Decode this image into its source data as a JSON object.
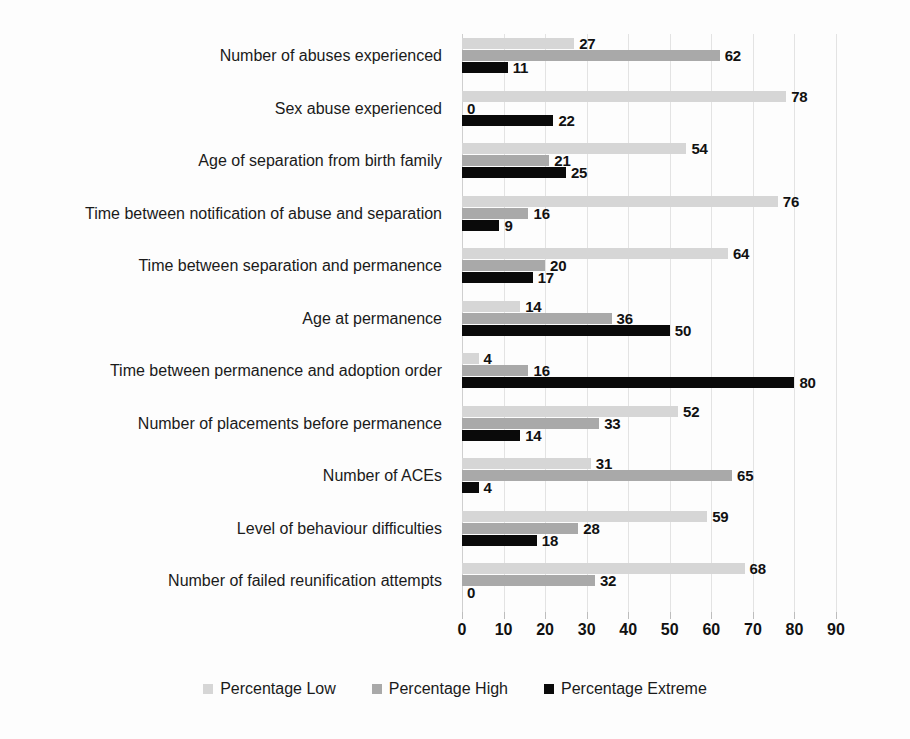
{
  "chart_data": {
    "type": "bar",
    "orientation": "horizontal",
    "title": "",
    "subtitle": "",
    "xlabel": "",
    "ylabel": "",
    "xlim": [
      0,
      90
    ],
    "xticks": [
      0,
      10,
      20,
      30,
      40,
      50,
      60,
      70,
      80,
      90
    ],
    "grid": true,
    "legend_position": "bottom",
    "categories": [
      "Number of abuses experienced",
      "Sex abuse experienced",
      "Age of separation from birth family",
      "Time between notification of abuse and separation",
      "Time between separation and permanence",
      "Age at permanence",
      "Time between permanence and adoption order",
      "Number of placements before permanence",
      "Number of ACEs",
      "Level of behaviour difficulties",
      "Number of failed reunification attempts"
    ],
    "series": [
      {
        "name": "Percentage Low",
        "color": "#d6d6d6",
        "values": [
          27,
          78,
          54,
          76,
          64,
          14,
          4,
          52,
          31,
          59,
          68
        ]
      },
      {
        "name": "Percentage High",
        "color": "#a9a9a9",
        "values": [
          62,
          0,
          21,
          16,
          20,
          36,
          16,
          33,
          65,
          28,
          32
        ]
      },
      {
        "name": "Percentage Extreme",
        "color": "#0a0a0a",
        "values": [
          11,
          22,
          25,
          9,
          17,
          50,
          80,
          14,
          4,
          18,
          0
        ]
      }
    ]
  },
  "legend": {
    "items": [
      {
        "label": "Percentage Low",
        "swatch": "low"
      },
      {
        "label": "Percentage High",
        "swatch": "high"
      },
      {
        "label": "Percentage Extreme",
        "swatch": "extreme"
      }
    ]
  }
}
